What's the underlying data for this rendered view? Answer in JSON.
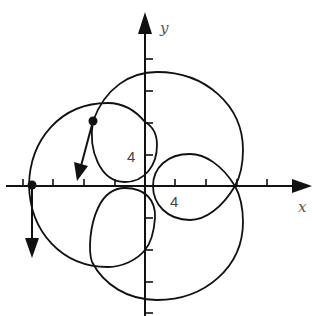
{
  "diagram": {
    "axes": {
      "x_label": "x",
      "y_label": "y",
      "x_tick_label": "4",
      "y_tick_label": "4",
      "tick_spacing_units": 4,
      "x_ticks": [
        -16,
        -12,
        -8,
        -4,
        4,
        8,
        12,
        16
      ],
      "y_ticks": [
        -16,
        -12,
        -8,
        -4,
        4,
        8,
        12,
        16
      ]
    },
    "points": [
      {
        "name": "upper-left-point",
        "approx_coords": [
          -7,
          8.3
        ],
        "vector_direction": "down-left"
      },
      {
        "name": "left-axis-point",
        "approx_coords": [
          -14.8,
          0
        ],
        "vector_direction": "down"
      }
    ],
    "colors": {
      "ink": "#111111",
      "label": "#555555",
      "background": "#ffffff"
    }
  }
}
